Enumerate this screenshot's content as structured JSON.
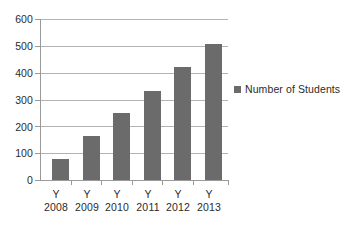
{
  "chart_data": {
    "type": "bar",
    "title": "",
    "xlabel": "",
    "ylabel": "",
    "categories": [
      "Y 2008",
      "Y 2009",
      "Y 2010",
      "Y 2011",
      "Y 2012",
      "Y 2013"
    ],
    "category_lines": [
      {
        "line1": "Y",
        "line2": "2008"
      },
      {
        "line1": "Y",
        "line2": "2009"
      },
      {
        "line1": "Y",
        "line2": "2010"
      },
      {
        "line1": "Y",
        "line2": "2011"
      },
      {
        "line1": "Y",
        "line2": "2012"
      },
      {
        "line1": "Y",
        "line2": "2013"
      }
    ],
    "series": [
      {
        "name": "Number of Students",
        "color": "#6b6b6b",
        "values": [
          80,
          165,
          248,
          330,
          420,
          508
        ]
      }
    ],
    "ylim": [
      0,
      600
    ],
    "ytick_step": 100,
    "yticks": [
      600,
      500,
      400,
      300,
      200,
      100,
      0
    ],
    "ytick_labels": [
      "600",
      "500",
      "400",
      "300",
      "200",
      "100",
      "0"
    ],
    "grid": true,
    "grid_axis": "y",
    "legend": {
      "position": "right",
      "entries": [
        {
          "label": "Number of Students",
          "color": "#6b6b6b"
        }
      ]
    },
    "colors": {
      "bar": "#6b6b6b",
      "grid": "#b3b3b3",
      "axis": "#9a9a9a",
      "text": "#2b2b2b",
      "background": "#ffffff"
    }
  }
}
